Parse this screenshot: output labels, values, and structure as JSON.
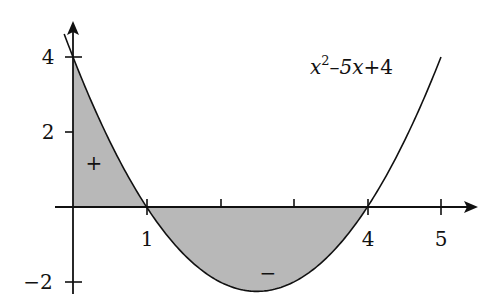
{
  "diagram": {
    "type": "function-area-plot",
    "function_label": {
      "base": "x",
      "exponent": "2",
      "rest_minus": "–",
      "rest_term": "5x",
      "rest_plus": "+4"
    },
    "function_expression": "x^2-5x+4",
    "x_axis": {
      "tick_values": [
        1,
        2,
        3,
        4,
        5
      ],
      "labeled_ticks": [
        {
          "value": 1,
          "label": "1"
        },
        {
          "value": 4,
          "label": "4"
        },
        {
          "value": 5,
          "label": "5"
        }
      ]
    },
    "y_axis": {
      "tick_values": [
        4,
        2,
        -2
      ],
      "labeled_ticks": [
        {
          "value": 4,
          "label": "4"
        },
        {
          "value": 2,
          "label": "2"
        },
        {
          "value": -2,
          "label": "−2"
        }
      ]
    },
    "shaded_regions": [
      {
        "from": 0,
        "to": 1,
        "sign": "positive",
        "marker": "+"
      },
      {
        "from": 1,
        "to": 4,
        "sign": "negative",
        "marker": "−"
      }
    ],
    "roots": [
      1,
      4
    ],
    "colors": {
      "shade": "#b8b8b8",
      "line": "#111111",
      "background": "#ffffff"
    }
  }
}
